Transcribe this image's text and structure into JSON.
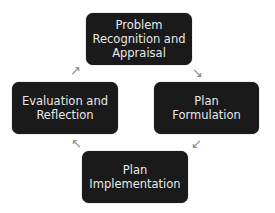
{
  "diagram": {
    "type": "cycle",
    "nodes": [
      {
        "id": "top",
        "label": "Problem\nRecognition and\nAppraisal"
      },
      {
        "id": "right",
        "label": "Plan\nFormulation"
      },
      {
        "id": "bottom",
        "label": "Plan\nImplementation"
      },
      {
        "id": "left",
        "label": "Evaluation and\nReflection"
      }
    ],
    "arrows": [
      {
        "from": "top",
        "to": "right",
        "glyph": "↘"
      },
      {
        "from": "right",
        "to": "bottom",
        "glyph": "↙"
      },
      {
        "from": "bottom",
        "to": "left",
        "glyph": "↖"
      },
      {
        "from": "left",
        "to": "top",
        "glyph": "↗"
      }
    ],
    "colors": {
      "box": "#1a1a1a",
      "text": "#e8e8e8",
      "arrow": "#8a8a8a"
    }
  }
}
